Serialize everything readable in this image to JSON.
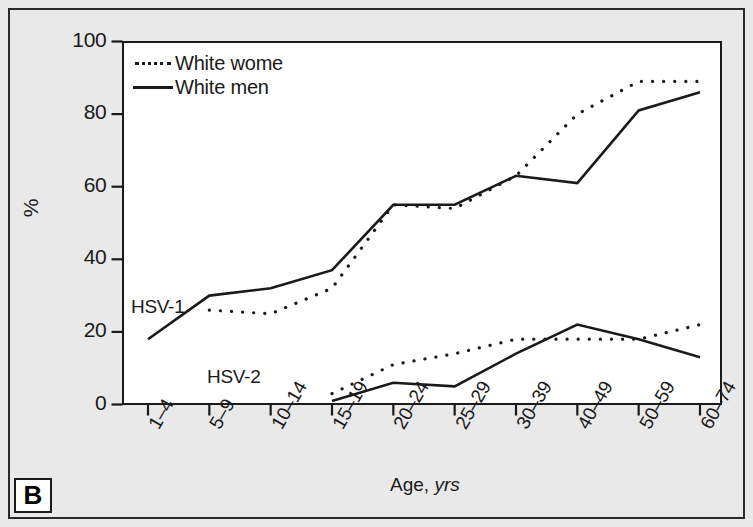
{
  "figure": {
    "panel_label": "B",
    "ylabel": "%",
    "xlabel_main": "Age,",
    "xlabel_unit": "yrs"
  },
  "legend": {
    "position": "top-left-inside",
    "items": [
      {
        "label": "White wome",
        "style": "dotted"
      },
      {
        "label": "White men",
        "style": "solid"
      }
    ]
  },
  "annotations": [
    {
      "text": "HSV-1",
      "x_category": "5–9",
      "y_value": 30
    },
    {
      "text": "HSV-2",
      "x_category": "15–19",
      "y_value": 9
    }
  ],
  "yticks": [
    "100",
    "80",
    "60",
    "40",
    "20",
    "0"
  ],
  "chart_data": {
    "type": "line",
    "title": "",
    "subtitle": "",
    "xlabel": "Age, yrs",
    "ylabel": "%",
    "ylim": [
      0,
      100
    ],
    "yticks": [
      0,
      20,
      40,
      60,
      80,
      100
    ],
    "grid": false,
    "legend_position": "top-left-inside",
    "categories": [
      "1–4",
      "5–9",
      "10–14",
      "15–19",
      "20–24",
      "25–29",
      "30–39",
      "40–49",
      "50–59",
      "60–74"
    ],
    "series": [
      {
        "name": "White women",
        "virus": "HSV-1",
        "style": "dotted",
        "color": "#1a1a1a",
        "values": [
          null,
          26,
          25,
          32,
          55,
          54,
          63,
          80,
          89,
          89
        ]
      },
      {
        "name": "White men",
        "virus": "HSV-1",
        "style": "solid",
        "color": "#1a1a1a",
        "values": [
          18,
          30,
          32,
          37,
          55,
          55,
          63,
          61,
          81,
          86
        ]
      },
      {
        "name": "White women",
        "virus": "HSV-2",
        "style": "dotted",
        "color": "#1a1a1a",
        "values": [
          null,
          null,
          null,
          3,
          11,
          14,
          18,
          18,
          18,
          22
        ]
      },
      {
        "name": "White men",
        "virus": "HSV-2",
        "style": "solid",
        "color": "#1a1a1a",
        "values": [
          null,
          null,
          null,
          1,
          6,
          5,
          14,
          22,
          18,
          13
        ]
      }
    ]
  }
}
